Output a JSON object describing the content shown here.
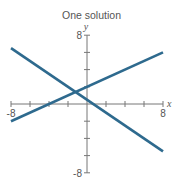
{
  "chart_data": {
    "type": "line",
    "title": "One solution",
    "xlabel": "x",
    "ylabel": "y",
    "xlim": [
      -8,
      8
    ],
    "ylim": [
      -8,
      8
    ],
    "x_tick_labels": [
      "-8",
      "8"
    ],
    "y_tick_labels": [
      "8",
      "-8"
    ],
    "tick_step": 2,
    "grid": false,
    "series": [
      {
        "name": "line 1",
        "x": [
          -8,
          8
        ],
        "y": [
          6.5,
          -5.5
        ],
        "color": "#2e6a8e"
      },
      {
        "name": "line 2",
        "x": [
          -8,
          8
        ],
        "y": [
          -2,
          6
        ],
        "color": "#2e6a8e"
      }
    ],
    "intersection": {
      "x": -1.2,
      "y": 1.4
    }
  }
}
